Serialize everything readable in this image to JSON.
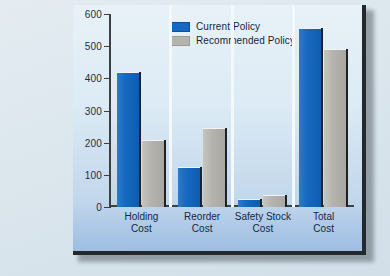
{
  "chart_data": {
    "type": "bar",
    "title": "",
    "xlabel": "",
    "ylabel": "",
    "ylim": [
      0,
      600
    ],
    "yticks": [
      0,
      100,
      200,
      300,
      400,
      500,
      600
    ],
    "grid": false,
    "legend_position": "top-center",
    "categories": [
      "Holding\nCost",
      "Reorder\nCost",
      "Safety Stock\nCost",
      "Total\nCost"
    ],
    "category_lines": [
      [
        "Holding",
        "Cost"
      ],
      [
        "Reorder",
        "Cost"
      ],
      [
        "Safety Stock",
        "Cost"
      ],
      [
        "Total",
        "Cost"
      ]
    ],
    "series": [
      {
        "name": "Current Policy",
        "color": "#1669c1",
        "values": [
          420,
          125,
          25,
          557
        ]
      },
      {
        "name": "Recommended Policy",
        "color": "#b5b3ae",
        "values": [
          208,
          245,
          38,
          492
        ]
      }
    ]
  },
  "axis": {
    "tick_labels": [
      "600",
      "500",
      "400",
      "300",
      "200",
      "100",
      "0"
    ]
  },
  "legend": {
    "items": [
      {
        "label": "Current Policy",
        "swatch": "legend-swatch-blue"
      },
      {
        "label": "Recommended Policy",
        "swatch": "legend-swatch-gray"
      }
    ]
  },
  "colors": {
    "current_policy": "#1669c1",
    "recommended_policy": "#b5b3ae",
    "panel_background": "#dcebf5",
    "page_background": "#dbe5ec",
    "axis": "#3b4045",
    "text": "#16263f"
  }
}
